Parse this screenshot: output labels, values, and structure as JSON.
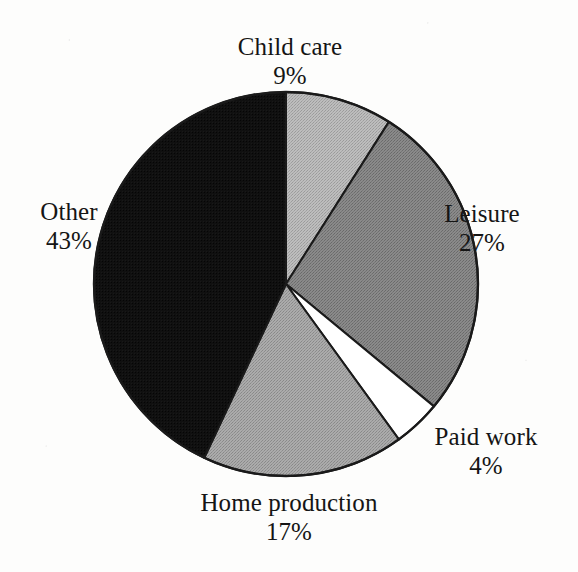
{
  "chart_data": {
    "type": "pie",
    "title": "",
    "subtitle": "",
    "xlabel": "",
    "ylabel": "",
    "legend_position": "none",
    "grid": false,
    "units": "percent",
    "total": 100,
    "start_angle_deg": 0,
    "direction": "clockwise",
    "categories": [
      "Child care",
      "Leisure",
      "Paid work",
      "Home production",
      "Other"
    ],
    "values": [
      9,
      27,
      4,
      17,
      43
    ],
    "labels": [
      "9%",
      "27%",
      "4%",
      "17%",
      "43%"
    ],
    "slices": [
      {
        "name": "Child care",
        "value": 9,
        "label": "9%",
        "color": "#b5b5b5",
        "stroke": "#1a1a1a",
        "start_deg": 0,
        "end_deg": 32.4
      },
      {
        "name": "Leisure",
        "value": 27,
        "label": "27%",
        "color": "#818181",
        "stroke": "#1a1a1a",
        "start_deg": 32.4,
        "end_deg": 129.6
      },
      {
        "name": "Paid work",
        "value": 4,
        "label": "4%",
        "color": "#ffffff",
        "stroke": "#1a1a1a",
        "start_deg": 129.6,
        "end_deg": 144.0
      },
      {
        "name": "Home production",
        "value": 17,
        "label": "17%",
        "color": "#a2a2a2",
        "stroke": "#1a1a1a",
        "start_deg": 144.0,
        "end_deg": 205.2
      },
      {
        "name": "Other",
        "value": 43,
        "label": "43%",
        "color": "#0d0d0d",
        "stroke": "#1a1a1a",
        "start_deg": 205.2,
        "end_deg": 360.0
      }
    ],
    "geometry": {
      "center_x": 286,
      "center_y": 284,
      "radius": 192
    }
  },
  "labels": {
    "child_care": {
      "name": "Child care",
      "pct": "9%"
    },
    "leisure": {
      "name": "Leisure",
      "pct": "27%"
    },
    "paid_work": {
      "name": "Paid work",
      "pct": "4%"
    },
    "home_production": {
      "name": "Home production",
      "pct": "17%"
    },
    "other": {
      "name": "Other",
      "pct": "43%"
    }
  },
  "colors": {
    "background": "#fdfdfc",
    "text": "#151515",
    "outline": "#1a1a1a",
    "child_care": "#b5b5b5",
    "leisure": "#818181",
    "paid_work": "#ffffff",
    "home_production": "#a2a2a2",
    "other": "#0d0d0d"
  }
}
